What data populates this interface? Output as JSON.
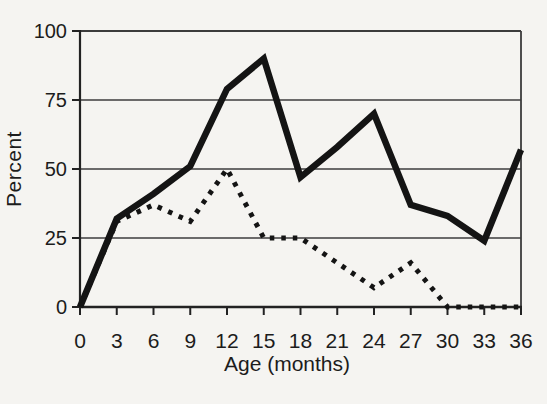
{
  "figure": {
    "kind": "scanned-book-line-chart",
    "background_color": "#f5f4f1",
    "line_color": "#141414",
    "grid_color": "#3c3c3c",
    "text_color": "#1c1c1c"
  },
  "chart_data": {
    "type": "line",
    "title": "",
    "xlabel": "Age (months)",
    "ylabel": "Percent",
    "x": [
      0,
      3,
      6,
      9,
      12,
      15,
      18,
      21,
      24,
      27,
      30,
      33,
      36
    ],
    "series": [
      {
        "name": "solid-line",
        "line_style": "solid",
        "values": [
          0,
          32,
          41,
          51,
          79,
          90,
          47,
          58,
          70,
          37,
          33,
          24,
          57
        ]
      },
      {
        "name": "dotted-line",
        "line_style": "dotted",
        "values": [
          0,
          31,
          37,
          31,
          50,
          25,
          25,
          16,
          7,
          16,
          0,
          0,
          0
        ]
      }
    ],
    "xticks": [
      "0",
      "3",
      "6",
      "9",
      "12",
      "15",
      "18",
      "21",
      "24",
      "27",
      "30",
      "33",
      "36"
    ],
    "yticks": [
      "0",
      "25",
      "50",
      "75",
      "100"
    ],
    "ytick_values": [
      0,
      25,
      50,
      75,
      100
    ],
    "xtick_values": [
      0,
      3,
      6,
      9,
      12,
      15,
      18,
      21,
      24,
      27,
      30,
      33,
      36
    ],
    "xlim": [
      0,
      36
    ],
    "ylim": [
      0,
      100
    ],
    "grid": "horizontal",
    "legend": "none"
  }
}
